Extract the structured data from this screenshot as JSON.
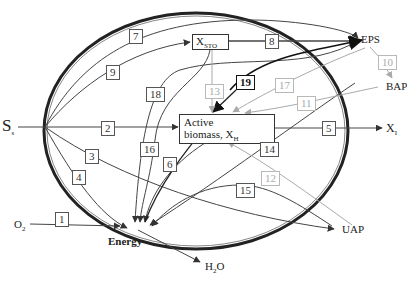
{
  "diagram": {
    "nodes": {
      "substrate": {
        "label": "S",
        "sub": "s"
      },
      "oxygen": {
        "label": "O",
        "sub": "2"
      },
      "energy": {
        "label": "Energy"
      },
      "water": {
        "label": "H",
        "sub": "2",
        "suffix": "O"
      },
      "storage": {
        "label": "X",
        "sub": "STO"
      },
      "active_biomass": {
        "line1": "Active",
        "line2": "biomass, X",
        "sub": "H"
      },
      "eps": {
        "label": "EPS"
      },
      "bap": {
        "label": "BAP"
      },
      "inert": {
        "label": "X",
        "sub": "I"
      },
      "uap": {
        "label": "UAP"
      }
    },
    "processes": [
      {
        "id": "1",
        "from": "O2",
        "to": "Energy",
        "style": "normal"
      },
      {
        "id": "2",
        "from": "Ss",
        "to": "Active biomass",
        "style": "normal"
      },
      {
        "id": "3",
        "from": "Ss",
        "to": "UAP",
        "style": "normal"
      },
      {
        "id": "4",
        "from": "Ss",
        "to": "Energy",
        "style": "normal"
      },
      {
        "id": "5",
        "from": "Active biomass",
        "to": "XI",
        "style": "normal"
      },
      {
        "id": "6",
        "from": "Active biomass",
        "to": "Energy",
        "style": "normal"
      },
      {
        "id": "7",
        "from": "Ss",
        "to": "EPS",
        "style": "normal"
      },
      {
        "id": "8",
        "from": "XSTO",
        "to": "EPS",
        "style": "normal"
      },
      {
        "id": "9",
        "from": "Ss",
        "to": "XSTO",
        "style": "normal"
      },
      {
        "id": "10",
        "from": "EPS",
        "to": "BAP",
        "style": "light"
      },
      {
        "id": "11",
        "from": "BAP",
        "to": "Active biomass",
        "style": "light"
      },
      {
        "id": "12",
        "from": "UAP",
        "to": "Active biomass",
        "style": "light"
      },
      {
        "id": "13",
        "from": "XSTO",
        "to": "Active biomass",
        "style": "light"
      },
      {
        "id": "14",
        "from": "BAP",
        "to": "Energy",
        "style": "normal"
      },
      {
        "id": "15",
        "from": "UAP",
        "to": "Energy",
        "style": "normal"
      },
      {
        "id": "16",
        "from": "XSTO",
        "to": "Energy",
        "style": "normal"
      },
      {
        "id": "17",
        "from": "EPS",
        "to": "Active biomass",
        "style": "light"
      },
      {
        "id": "18",
        "from": "EPS",
        "to": "Energy",
        "style": "normal"
      },
      {
        "id": "19",
        "from": "Energy",
        "to": "EPS",
        "style": "bold"
      }
    ]
  }
}
